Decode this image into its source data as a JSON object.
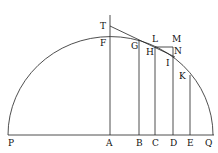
{
  "diagram": {
    "labels": {
      "T": "T",
      "F": "F",
      "G": "G",
      "L": "L",
      "M": "M",
      "H": "H",
      "N": "N",
      "I": "I",
      "K": "K",
      "P": "P",
      "A": "A",
      "B": "B",
      "C": "C",
      "D": "D",
      "E": "E",
      "Q": "Q"
    },
    "colors": {
      "ink": "#222222",
      "background": "#ffffff"
    }
  }
}
